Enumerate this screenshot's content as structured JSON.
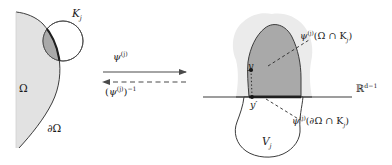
{
  "figure": {
    "background_color": "#ffffff",
    "width": 392,
    "height": 165
  },
  "colors": {
    "stroke": "#3c3c3c",
    "text": "#1a1a1a",
    "omega_fill": "#e2e2e2",
    "cap_dark_fill": "#a9a9a9",
    "circle_fill": "#ffffff",
    "outer_blob_fill": "#ebebeb",
    "dome_fill": "#a9a9a9",
    "vj_fill": "#ffffff",
    "arrow_color": "#4a4a4a"
  },
  "left_panel": {
    "name": "domain-omega-panel",
    "region_label": "Ω",
    "boundary_label": "∂Ω",
    "compact_set_label_base": "K",
    "compact_set_label_sub": "j"
  },
  "arrows": {
    "forward": {
      "name": "forward-map-arrow",
      "style": "solid",
      "direction": "right",
      "label_base": "ψ",
      "label_sup": "(j)"
    },
    "inverse": {
      "name": "inverse-map-arrow",
      "style": "dashed",
      "direction": "left",
      "label_open": "(",
      "label_base": "ψ",
      "label_sup_inner": "(j)",
      "label_close": ")",
      "label_sup_outer": "−1"
    }
  },
  "right_panel": {
    "name": "image-chart-panel",
    "hyperplane_label_base": "ℝ",
    "hyperplane_label_sup": "d−1",
    "point_upper": "y",
    "point_lower": "y′",
    "lower_set_base": "V",
    "lower_set_sub": "j",
    "upper_image_label": {
      "base": "ψ",
      "sup": "(j)",
      "arg": "(Ω ∩ K",
      "arg_sub": "j",
      "arg_close": ")"
    },
    "boundary_image_label": {
      "base": "ψ",
      "sup": "(j)",
      "arg": "(∂Ω ∩ K",
      "arg_sub": "j",
      "arg_close": ")"
    }
  }
}
